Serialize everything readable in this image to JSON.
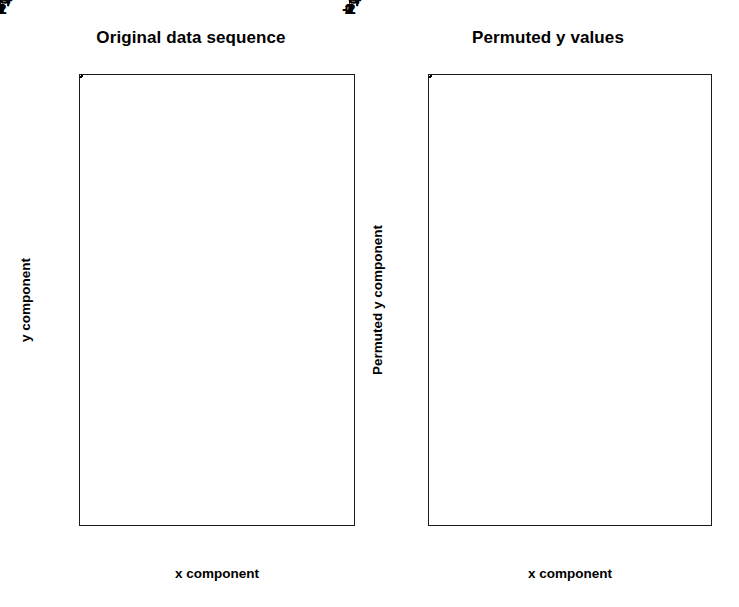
{
  "figure": {
    "background": "#ffffff",
    "foreground": "#000000",
    "marker": "open-circle"
  },
  "panels": [
    {
      "id": "original",
      "title": "Original data sequence",
      "xlabel": "x component",
      "ylabel": "y component"
    },
    {
      "id": "permuted",
      "title": "Permuted y values",
      "xlabel": "x component",
      "ylabel": "Permuted y component"
    }
  ],
  "chart_data": [
    {
      "type": "scatter",
      "title": "Original data sequence",
      "xlabel": "x component",
      "ylabel": "y component",
      "xlim": [
        -2.35,
        2.55
      ],
      "ylim": [
        -2.25,
        2.65
      ],
      "xticks": [
        -2,
        -1,
        0,
        1,
        2
      ],
      "yticks": [
        -2,
        -1,
        0,
        1,
        2
      ],
      "xticklabels": [
        "-2",
        "-1",
        "0",
        "1",
        "2"
      ],
      "yticklabels": [
        "-2",
        "-1",
        "0",
        "1",
        "2"
      ],
      "grid": false,
      "legend": null,
      "n_points": 100,
      "correlation_note": "strong positive linear association",
      "points": [
        [
          2.29,
          2.52
        ],
        [
          1.72,
          2.16
        ],
        [
          2.05,
          1.99
        ],
        [
          1.89,
          1.7
        ],
        [
          1.6,
          1.52
        ],
        [
          1.43,
          1.48
        ],
        [
          1.5,
          1.48
        ],
        [
          0.97,
          1.45
        ],
        [
          1.0,
          1.39
        ],
        [
          1.9,
          1.28
        ],
        [
          0.99,
          1.33
        ],
        [
          1.03,
          1.23
        ],
        [
          1.05,
          1.21
        ],
        [
          0.43,
          1.2
        ],
        [
          1.35,
          1.01
        ],
        [
          0.92,
          0.99
        ],
        [
          0.77,
          1.0
        ],
        [
          1.3,
          0.93
        ],
        [
          1.24,
          0.83
        ],
        [
          0.38,
          0.84
        ],
        [
          0.1,
          0.7
        ],
        [
          0.29,
          0.72
        ],
        [
          0.58,
          0.72
        ],
        [
          0.94,
          0.7
        ],
        [
          0.12,
          0.56
        ],
        [
          0.24,
          0.58
        ],
        [
          0.7,
          0.6
        ],
        [
          0.64,
          0.6
        ],
        [
          0.02,
          0.52
        ],
        [
          0.43,
          0.5
        ],
        [
          0.53,
          0.47
        ],
        [
          1.02,
          0.53
        ],
        [
          0.86,
          0.47
        ],
        [
          1.15,
          0.47
        ],
        [
          1.18,
          0.45
        ],
        [
          0.3,
          0.41
        ],
        [
          0.62,
          0.4
        ],
        [
          0.67,
          0.38
        ],
        [
          0.32,
          0.3
        ],
        [
          0.08,
          0.28
        ],
        [
          0.35,
          0.3
        ],
        [
          0.45,
          0.29
        ],
        [
          0.82,
          0.33
        ],
        [
          1.67,
          0.3
        ],
        [
          1.78,
          0.31
        ],
        [
          0.74,
          0.22
        ],
        [
          0.2,
          0.2
        ],
        [
          0.22,
          0.19
        ],
        [
          0.25,
          0.19
        ],
        [
          0.42,
          0.2
        ],
        [
          0.5,
          0.1
        ],
        [
          -0.15,
          0.14
        ],
        [
          0.28,
          0.05
        ],
        [
          0.12,
          0.0
        ],
        [
          0.56,
          0.02
        ],
        [
          -0.6,
          0.1
        ],
        [
          0.15,
          -0.05
        ],
        [
          0.05,
          -0.08
        ],
        [
          0.62,
          -0.08
        ],
        [
          0.7,
          -0.12
        ],
        [
          0.9,
          -0.12
        ],
        [
          0.18,
          -0.18
        ],
        [
          0.32,
          -0.22
        ],
        [
          0.46,
          -0.26
        ],
        [
          1.47,
          -0.22
        ],
        [
          0.2,
          -0.3
        ],
        [
          0.1,
          -0.33
        ],
        [
          -0.42,
          -0.38
        ],
        [
          -0.4,
          -0.4
        ],
        [
          0.04,
          -0.42
        ],
        [
          -0.3,
          -0.48
        ],
        [
          -0.08,
          -0.5
        ],
        [
          0.6,
          -0.52
        ],
        [
          -0.9,
          -0.62
        ],
        [
          -1.14,
          -0.67
        ],
        [
          -0.55,
          -0.68
        ],
        [
          -0.52,
          -0.7
        ],
        [
          -0.7,
          -0.72
        ],
        [
          -0.98,
          -0.78
        ],
        [
          -1.4,
          -0.82
        ],
        [
          -1.49,
          -0.86
        ],
        [
          -1.46,
          -0.87
        ],
        [
          -0.22,
          -0.88
        ],
        [
          -1.52,
          -1.02
        ],
        [
          -1.28,
          -1.03
        ],
        [
          -1.05,
          -1.1
        ],
        [
          -1.02,
          -1.12
        ],
        [
          -1.9,
          -1.18
        ],
        [
          -1.6,
          -1.23
        ],
        [
          -1.38,
          -1.27
        ],
        [
          -1.72,
          -1.3
        ],
        [
          -1.1,
          -1.35
        ],
        [
          -0.36,
          -0.9
        ],
        [
          -0.7,
          -0.35
        ],
        [
          0.2,
          -0.6
        ],
        [
          -1.85,
          -1.78
        ],
        [
          -1.92,
          -2.02
        ],
        [
          -1.4,
          -2.06
        ],
        [
          0.35,
          -0.35
        ],
        [
          0.05,
          0.38
        ]
      ]
    },
    {
      "type": "scatter",
      "title": "Permuted y values",
      "xlabel": "x component",
      "ylabel": "Permuted y component",
      "xlim": [
        -2.35,
        2.55
      ],
      "ylim": [
        -2.25,
        2.65
      ],
      "xticks": [
        -2,
        -1,
        0,
        1,
        2
      ],
      "yticks": [
        -2,
        -1,
        0,
        1,
        2
      ],
      "xticklabels": [
        "-2",
        "-1",
        "0",
        "1",
        "2"
      ],
      "yticklabels": [
        "-2",
        "-1",
        "0",
        "1",
        "2"
      ],
      "grid": false,
      "legend": null,
      "n_points": 100,
      "correlation_note": "no association after permutation",
      "points": [
        [
          -0.38,
          2.52
        ],
        [
          -0.82,
          2.0
        ],
        [
          0.78,
          1.86
        ],
        [
          -0.76,
          1.52
        ],
        [
          -0.57,
          1.45
        ],
        [
          0.8,
          1.45
        ],
        [
          0.95,
          1.42
        ],
        [
          -0.67,
          1.2
        ],
        [
          -0.58,
          1.12
        ],
        [
          -0.47,
          1.17
        ],
        [
          0.78,
          1.18
        ],
        [
          0.92,
          1.1
        ],
        [
          -1.75,
          1.16
        ],
        [
          -0.45,
          1.03
        ],
        [
          -0.22,
          1.03
        ],
        [
          2.25,
          1.05
        ],
        [
          -0.3,
          0.87
        ],
        [
          -0.13,
          0.8
        ],
        [
          0.28,
          0.82
        ],
        [
          0.4,
          0.82
        ],
        [
          -2.05,
          0.75
        ],
        [
          -1.5,
          0.72
        ],
        [
          -1.38,
          0.72
        ],
        [
          -1.1,
          0.78
        ],
        [
          -0.78,
          0.7
        ],
        [
          -0.36,
          0.73
        ],
        [
          -0.34,
          0.73
        ],
        [
          -0.2,
          0.65
        ],
        [
          -0.05,
          0.63
        ],
        [
          0.1,
          0.6
        ],
        [
          0.58,
          0.6
        ],
        [
          0.88,
          0.6
        ],
        [
          -1.82,
          0.55
        ],
        [
          0.07,
          0.58
        ],
        [
          -1.25,
          0.46
        ],
        [
          0.55,
          0.7
        ],
        [
          1.3,
          0.73
        ],
        [
          1.58,
          0.7
        ],
        [
          1.9,
          0.66
        ],
        [
          -1.98,
          0.58
        ],
        [
          -1.62,
          0.64
        ],
        [
          -1.42,
          0.63
        ],
        [
          -1.08,
          0.52
        ],
        [
          -0.5,
          0.66
        ],
        [
          -0.3,
          0.62
        ],
        [
          -0.28,
          0.6
        ],
        [
          -0.12,
          0.58
        ],
        [
          0.02,
          0.56
        ],
        [
          0.46,
          0.47
        ],
        [
          0.62,
          0.46
        ],
        [
          0.7,
          0.46
        ],
        [
          0.8,
          0.45
        ],
        [
          -0.95,
          0.38
        ],
        [
          -0.72,
          0.36
        ],
        [
          -0.62,
          0.36
        ],
        [
          -0.18,
          0.34
        ],
        [
          0.12,
          0.32
        ],
        [
          0.36,
          0.38
        ],
        [
          0.98,
          0.35
        ],
        [
          1.3,
          0.36
        ],
        [
          1.52,
          0.32
        ],
        [
          -0.85,
          0.27
        ],
        [
          -0.3,
          0.26
        ],
        [
          0.08,
          0.28
        ],
        [
          1.42,
          0.3
        ],
        [
          -1.55,
          0.18
        ],
        [
          -0.55,
          0.12
        ],
        [
          -0.33,
          0.14
        ],
        [
          0.16,
          0.14
        ],
        [
          0.18,
          0.08
        ],
        [
          0.2,
          0.02
        ],
        [
          0.22,
          -0.02
        ],
        [
          1.12,
          0.12
        ],
        [
          1.0,
          -0.02
        ],
        [
          1.05,
          -0.06
        ],
        [
          -1.28,
          -0.08
        ],
        [
          -0.72,
          -0.1
        ],
        [
          -0.48,
          -0.07
        ],
        [
          -0.35,
          -0.05
        ],
        [
          0.92,
          -0.2
        ],
        [
          -0.8,
          -0.22
        ],
        [
          -0.18,
          -0.2
        ],
        [
          -0.08,
          -0.3
        ],
        [
          0.86,
          -0.28
        ],
        [
          -1.45,
          -0.44
        ],
        [
          -0.6,
          -0.52
        ],
        [
          0.3,
          -0.5
        ],
        [
          0.5,
          -0.55
        ],
        [
          -0.95,
          -0.72
        ],
        [
          0.62,
          -0.92
        ],
        [
          -0.85,
          -1.28
        ],
        [
          0.4,
          -1.42
        ],
        [
          1.92,
          1.4
        ],
        [
          1.78,
          1.45
        ],
        [
          -1.1,
          0.92
        ],
        [
          0.42,
          -0.12
        ],
        [
          0.44,
          -0.18
        ],
        [
          0.45,
          -0.26
        ],
        [
          0.47,
          -0.32
        ],
        [
          0.35,
          0.1
        ]
      ]
    }
  ]
}
